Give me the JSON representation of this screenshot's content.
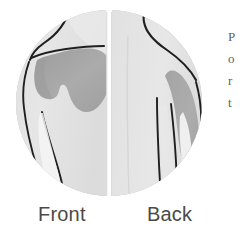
{
  "figure": {
    "name": "shoulder-pain-distribution-diagram",
    "labels": {
      "front": "Front",
      "back": "Back"
    },
    "margin_text_lines": [
      "P",
      "o",
      "r",
      "t"
    ],
    "colors": {
      "page_background": "#ffffff",
      "circle_fill": "#e8e8e8",
      "circle_edge": "#bdbdbd",
      "body_fill": "#e2e2e2",
      "body_highlight": "#f4f4f4",
      "pain_region": "#a8a8a8",
      "pain_region_dark": "#9d9d9d",
      "outline_stroke": "#1f1f1f",
      "label_text": "#4a4a4a",
      "divider": "#ffffff"
    },
    "panels": [
      {
        "id": "front",
        "label": "Front",
        "view": "anterior",
        "pain_region": "anterior shoulder and upper chest / deltoid and pectoral area",
        "pain_shade": "#a8a8a8"
      },
      {
        "id": "back",
        "label": "Back",
        "view": "posterior",
        "pain_region": "posterior lateral upper arm / outer deltoid band",
        "pain_shade": "#a8a8a8"
      }
    ],
    "geometry": {
      "circle_center_x": 109,
      "circle_center_y": 103,
      "circle_radius": 93,
      "divider_x": 109
    }
  }
}
